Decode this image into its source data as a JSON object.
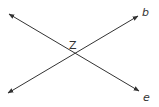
{
  "diagram": {
    "type": "intersecting-lines",
    "intersection_label": "Z",
    "lines": [
      {
        "label": "b",
        "from": [
          8,
          93
        ],
        "to": [
          138,
          16
        ]
      },
      {
        "label": "e",
        "from": [
          9,
          14
        ],
        "to": [
          139,
          91
        ]
      }
    ],
    "stroke_color": "#333333"
  }
}
